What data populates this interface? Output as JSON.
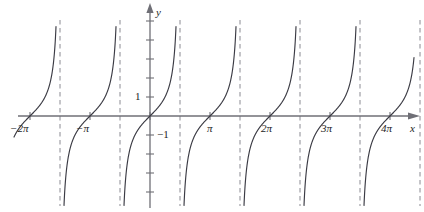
{
  "figure": {
    "kind": "cartesian-graph",
    "background": "#ffffff",
    "curve_color": "#3b3b44",
    "axis_color": "#6f6f76",
    "asymptote_color": "#8a8a92",
    "label_color": "#1d1d1d",
    "axis_labels": {
      "x": "x",
      "y": "y"
    },
    "y_tick_labels": [
      {
        "value": 1,
        "text": "1"
      },
      {
        "value": -1,
        "text": "−1"
      }
    ],
    "x_tick_labels": [
      {
        "value": "-2pi",
        "text": "−2π",
        "coef": "−2",
        "sym": "π"
      },
      {
        "value": "-pi",
        "text": "−π",
        "coef": "−",
        "sym": "π"
      },
      {
        "value": "pi",
        "text": "π",
        "coef": "",
        "sym": "π"
      },
      {
        "value": "2pi",
        "text": "2π",
        "coef": "2",
        "sym": "π"
      },
      {
        "value": "3pi",
        "text": "3π",
        "coef": "3",
        "sym": "π"
      },
      {
        "value": "4pi",
        "text": "4π",
        "coef": "4",
        "sym": "π"
      }
    ]
  },
  "chart_data": {
    "type": "line",
    "title": "",
    "subtitle": "",
    "xlabel": "x",
    "ylabel": "y",
    "function": "y = tan(x)",
    "grid": false,
    "legend": null,
    "xlim": [
      -2.2831853,
      13.3,
      "radians"
    ],
    "ylim": [
      -3.1,
      3.1
    ],
    "x_unit": "pi",
    "x_ticks": [
      -6.2831853,
      -3.1415927,
      0,
      3.1415927,
      6.2831853,
      9.424778,
      12.5663706
    ],
    "x_tick_labels": [
      "−2π",
      "−π",
      "",
      "π",
      "2π",
      "3π",
      "4π"
    ],
    "y_ticks": [
      -3,
      -2,
      -1,
      0,
      1,
      2,
      3
    ],
    "y_tick_labels": [
      "",
      "",
      "−1",
      "",
      "1",
      "",
      ""
    ],
    "zeros": [
      "−2π",
      "−π",
      "0",
      "π",
      "2π",
      "3π",
      "4π"
    ],
    "asymptotes": [
      "−3π/2",
      "−π/2",
      "π/2",
      "3π/2",
      "5π/2",
      "7π/2",
      "9π/2"
    ],
    "branches": 7,
    "period": "π",
    "annotations": []
  },
  "geometry": {
    "origin_x": 150,
    "origin_y": 116,
    "px_per_pi": 60,
    "px_per_unit_y": 19,
    "x_axis_left": 18,
    "x_axis_right": 412,
    "y_axis_top": 10,
    "y_axis_bottom": 208,
    "y_clip_top": 22,
    "y_clip_bottom": 206
  }
}
